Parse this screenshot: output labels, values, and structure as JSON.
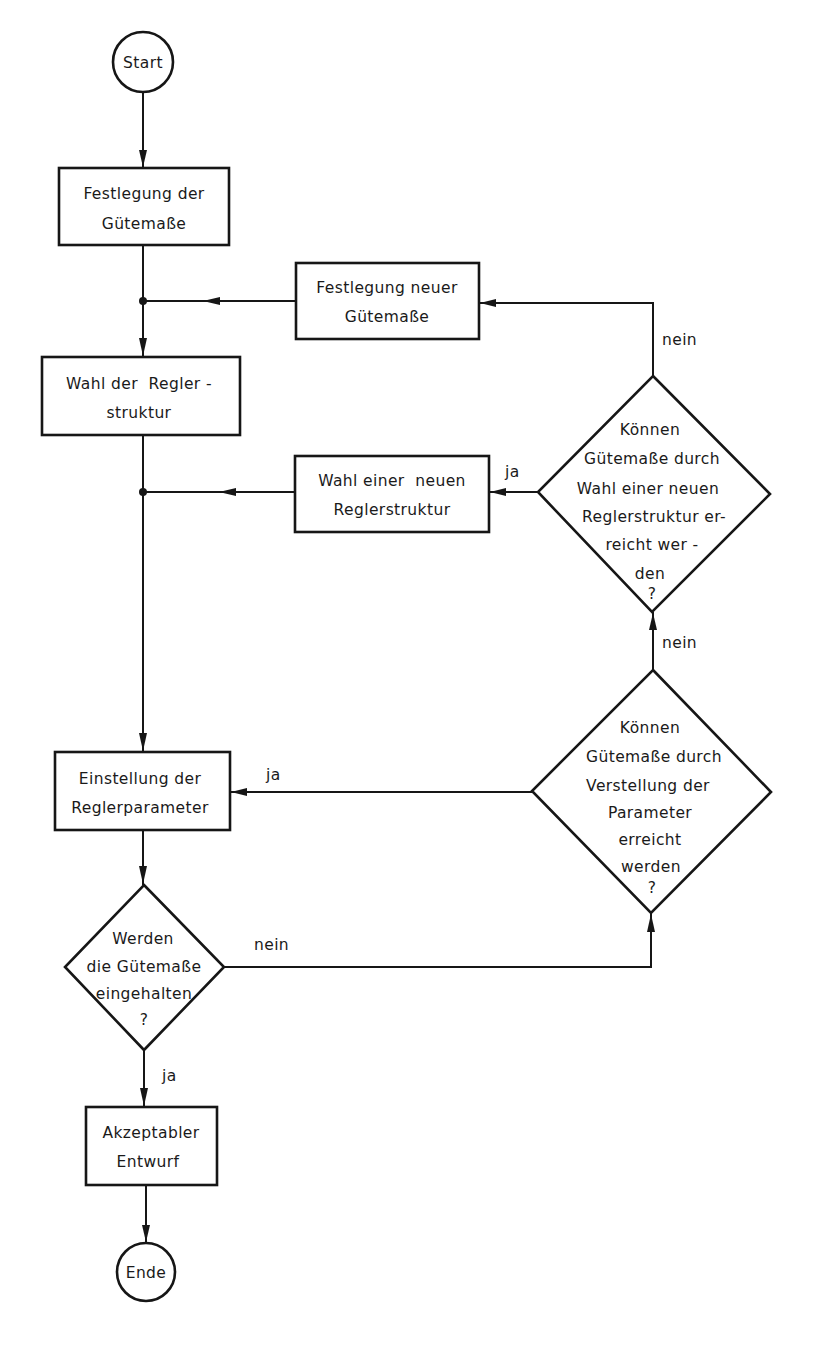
{
  "diagram": {
    "type": "flowchart",
    "language": "de",
    "terminals": {
      "start": "Start",
      "end": "Ende"
    },
    "processes": {
      "define_quality": [
        "Festlegung der",
        "Gütemaße"
      ],
      "define_new_quality": [
        "Festlegung neuer",
        "Gütemaße"
      ],
      "choose_structure": [
        "Wahl der  Regler -",
        "struktur"
      ],
      "choose_new_structure": [
        "Wahl einer  neuen",
        "Reglerstruktur"
      ],
      "set_parameters": [
        "Einstellung der",
        "Reglerparameter"
      ],
      "accept_design": [
        "Akzeptabler",
        "Entwurf"
      ]
    },
    "decisions": {
      "new_structure_q": [
        "Können",
        "Gütemaße durch",
        "Wahl einer neuen",
        "Reglerstruktur er-",
        "reicht wer -",
        "den",
        "?"
      ],
      "adjust_params_q": [
        "Können",
        "Gütemaße durch",
        "Verstellung der",
        "Parameter",
        "erreicht",
        "werden",
        "?"
      ],
      "quality_met_q": [
        "Werden",
        "die Gütemaße",
        "eingehalten",
        "?"
      ]
    },
    "edge_labels": {
      "new_structure_no": "nein",
      "new_structure_yes": "ja",
      "adjust_params_no": "nein",
      "adjust_params_yes": "ja",
      "quality_met_no": "nein",
      "quality_met_yes": "ja"
    }
  }
}
